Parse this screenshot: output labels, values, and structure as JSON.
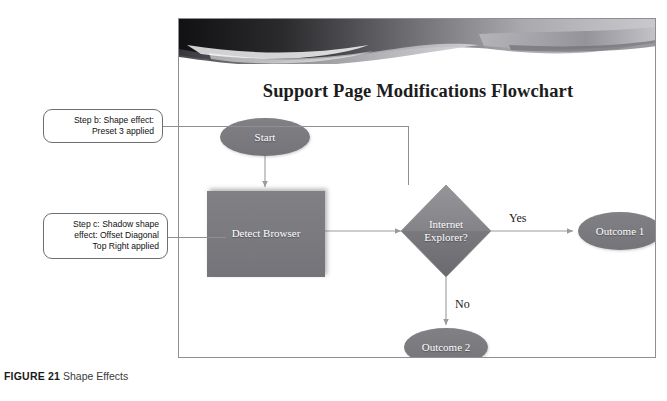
{
  "figure": {
    "number_label": "FIGURE 21",
    "caption_text": "Shape Effects"
  },
  "slide": {
    "title": "Support Page Modifications Flowchart",
    "banner_name": "wave-banner-graphic"
  },
  "callouts": [
    {
      "id": "step-b",
      "line1": "Step b: Shape effect:",
      "line2": "Preset 3 applied",
      "target": "Internet Explorer? diamond"
    },
    {
      "id": "step-c",
      "line1": "Step c: Shadow shape",
      "line2": "effect: Offset Diagonal",
      "line3": "Top Right applied",
      "target": "Detect Browser rectangle"
    }
  ],
  "flowchart": {
    "type": "flowchart",
    "nodes": [
      {
        "id": "start",
        "label": "Start",
        "shape": "ellipse"
      },
      {
        "id": "detect",
        "label": "Detect Browser",
        "shape": "rectangle"
      },
      {
        "id": "decision",
        "label_line1": "Internet",
        "label_line2": "Explorer?",
        "shape": "diamond"
      },
      {
        "id": "outcome1",
        "label": "Outcome 1",
        "shape": "ellipse"
      },
      {
        "id": "outcome2",
        "label": "Outcome 2",
        "shape": "ellipse"
      }
    ],
    "edges": [
      {
        "from": "start",
        "to": "detect",
        "label": ""
      },
      {
        "from": "detect",
        "to": "decision",
        "label": ""
      },
      {
        "from": "decision",
        "to": "outcome1",
        "label": "Yes"
      },
      {
        "from": "decision",
        "to": "outcome2",
        "label": "No"
      }
    ]
  },
  "colors": {
    "shape_fill": "#7a7a7a",
    "shape_fill_light": "#9a9a9a",
    "shape_fill_dark": "#6a6a6a",
    "connector": "#9b9b9f",
    "frame_border": "#8e8e93",
    "text_on_shape": "#ffffff",
    "page_background": "#ffffff"
  }
}
